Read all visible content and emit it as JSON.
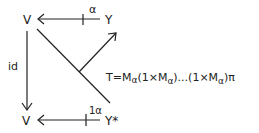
{
  "diagram": {
    "nodes": {
      "top_left": "V",
      "top_right": "Y",
      "bottom_left": "V",
      "bottom_right": "Y*"
    },
    "arrows": {
      "top_label": "α",
      "bottom_label": "1α",
      "left_label": "id"
    },
    "formula": {
      "prefix": "T=M",
      "sub1": "α",
      "part2": "(1×M",
      "sub2": "α",
      "part3": ")...(1×M",
      "sub3": "α",
      "part4": ")π"
    }
  }
}
